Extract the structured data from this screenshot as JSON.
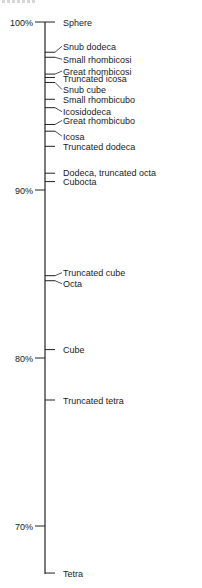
{
  "chart_data": {
    "type": "scatter",
    "title": "",
    "xlabel": "",
    "ylabel": "",
    "ylim": [
      67,
      100
    ],
    "grid": false,
    "legend": null,
    "y_ticks": [
      {
        "value": 100,
        "label": "100%"
      },
      {
        "value": 90,
        "label": "90%"
      },
      {
        "value": 80,
        "label": "80%"
      },
      {
        "value": 70,
        "label": "70%"
      }
    ],
    "points": [
      {
        "label": "Sphere",
        "value": 100.0,
        "label_y_offset": 0,
        "leader": "straight"
      },
      {
        "label": "Snub dodeca",
        "value": 98.2,
        "label_y_offset": -6,
        "leader": "angled"
      },
      {
        "label": "Small rhombicosi",
        "value": 97.9,
        "label_y_offset": 2,
        "leader": "straight"
      },
      {
        "label": "Great rhombicosi",
        "value": 96.9,
        "label_y_offset": -3,
        "leader": "angled"
      },
      {
        "label": "Truncated icosa",
        "value": 96.7,
        "label_y_offset": 1,
        "leader": "straight"
      },
      {
        "label": "Snub cube",
        "value": 96.4,
        "label_y_offset": 7,
        "leader": "angled"
      },
      {
        "label": "Small rhombicubo",
        "value": 95.4,
        "label_y_offset": 0,
        "leader": "straight"
      },
      {
        "label": "Icosidodeca",
        "value": 94.9,
        "label_y_offset": 4,
        "leader": "angled"
      },
      {
        "label": "Great rhombicubo",
        "value": 93.9,
        "label_y_offset": -4,
        "leader": "straight"
      },
      {
        "label": "Icosa",
        "value": 93.5,
        "label_y_offset": 5,
        "leader": "angled"
      },
      {
        "label": "Truncated dodeca",
        "value": 92.6,
        "label_y_offset": 0,
        "leader": "straight"
      },
      {
        "label": "Dodeca, truncated octa",
        "value": 91.0,
        "label_y_offset": -1,
        "leader": "straight"
      },
      {
        "label": "Cubocta",
        "value": 90.5,
        "label_y_offset": 0,
        "leader": "straight"
      },
      {
        "label": "Truncated cube",
        "value": 84.9,
        "label_y_offset": -3,
        "leader": "straight"
      },
      {
        "label": "Octa",
        "value": 84.6,
        "label_y_offset": 3,
        "leader": "straight"
      },
      {
        "label": "Cube",
        "value": 80.5,
        "label_y_offset": 0,
        "leader": "straight"
      },
      {
        "label": "Truncated tetra",
        "value": 77.5,
        "label_y_offset": 0,
        "leader": "straight"
      },
      {
        "label": "Tetra",
        "value": 67.2,
        "label_y_offset": 0,
        "leader": "straight"
      }
    ]
  },
  "layout": {
    "axis_x": 45,
    "y_at_100": 22,
    "px_per_percent": 16.8,
    "axis_bottom": 574,
    "label_x": 63,
    "tick_label_right_x": 33
  }
}
